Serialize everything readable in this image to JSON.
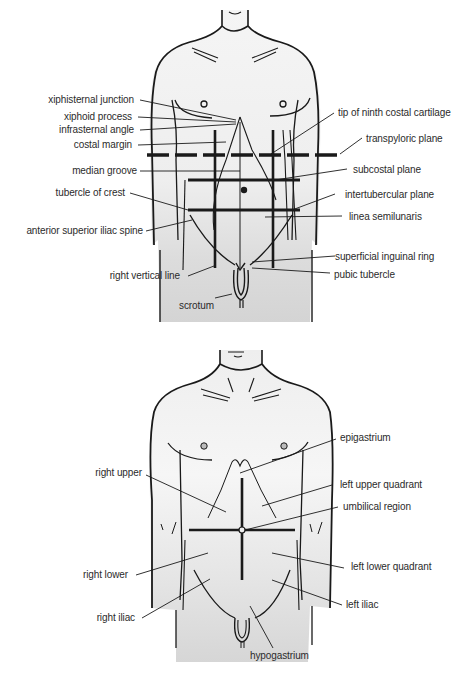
{
  "top_figure": {
    "title": "Surface anatomy of anterior abdominal wall — planes and landmarks",
    "labels_left": [
      {
        "id": "xiphisternal-junction",
        "text": "xiphisternal junction"
      },
      {
        "id": "xiphoid-process",
        "text": "xiphoid process"
      },
      {
        "id": "infrasternal-angle",
        "text": "infrasternal angle"
      },
      {
        "id": "costal-margin",
        "text": "costal margin"
      },
      {
        "id": "median-groove",
        "text": "median groove"
      },
      {
        "id": "tubercle-of-crest",
        "text": "tubercle of crest"
      },
      {
        "id": "anterior-superior-iliac-spine",
        "text": "anterior superior iliac spine"
      },
      {
        "id": "right-vertical-line",
        "text": "right vertical line"
      },
      {
        "id": "scrotum",
        "text": "scrotum"
      }
    ],
    "labels_right": [
      {
        "id": "tip-of-ninth-costal-cartilage",
        "text": "tip of ninth costal cartilage"
      },
      {
        "id": "transpyloric-plane",
        "text": "transpyloric plane"
      },
      {
        "id": "subcostal-plane",
        "text": "subcostal plane"
      },
      {
        "id": "intertubercular-plane",
        "text": "intertubercular plane"
      },
      {
        "id": "linea-semilunaris",
        "text": "linea semilunaris"
      },
      {
        "id": "superficial-inguinal-ring",
        "text": "superficial inguinal ring"
      },
      {
        "id": "pubic-tubercle",
        "text": "pubic tubercle"
      }
    ]
  },
  "bottom_figure": {
    "title": "Abdominal quadrants and regions",
    "labels_left": [
      {
        "id": "right-upper",
        "text": "right upper"
      },
      {
        "id": "right-lower",
        "text": "right lower"
      },
      {
        "id": "right-iliac",
        "text": "right iliac"
      }
    ],
    "labels_right": [
      {
        "id": "epigastrium",
        "text": "epigastrium"
      },
      {
        "id": "left-upper-quadrant",
        "text": "left upper quadrant"
      },
      {
        "id": "umbilical-region",
        "text": "umbilical region"
      },
      {
        "id": "left-lower-quadrant",
        "text": "left lower quadrant"
      },
      {
        "id": "left-iliac",
        "text": "left iliac"
      }
    ],
    "labels_bottom": [
      {
        "id": "hypogastrium",
        "text": "hypogastrium"
      }
    ]
  },
  "colors": {
    "ink": "#1a1a1a",
    "skin_light": "#f2f2f2",
    "skin_shade": "#d9d9d9",
    "label_text": "#2b2b2b"
  }
}
